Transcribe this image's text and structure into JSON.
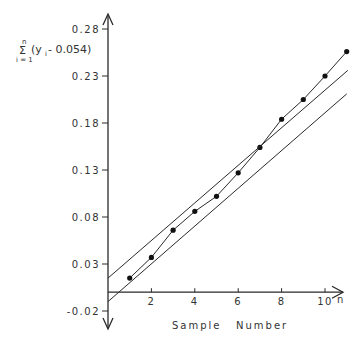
{
  "chart_data": {
    "type": "line",
    "title": "",
    "xlabel": "Sample Number",
    "xlabel_words": [
      "Sample",
      "Number"
    ],
    "x_axis_symbol": "n",
    "ylabel": "Σ (y_i - 0.054), i = 1 to n",
    "ylabel_parts": {
      "sigma": "Σ",
      "upper": "n",
      "lower": "i = 1",
      "expr_open": "(y",
      "sub": "i",
      "expr_close": " - 0.054)"
    },
    "x_ticks": [
      "2",
      "4",
      "6",
      "8",
      "10"
    ],
    "x_tick_values": [
      2,
      4,
      6,
      8,
      10
    ],
    "y_ticks": [
      "0.28",
      "0.23",
      "0.18",
      "0.13",
      "0.08",
      "0.03",
      "-0.02"
    ],
    "y_tick_values": [
      0.28,
      0.23,
      0.18,
      0.13,
      0.08,
      0.03,
      -0.02
    ],
    "xlim": [
      0,
      11.5
    ],
    "ylim": [
      -0.02,
      0.28
    ],
    "grid": false,
    "legend": null,
    "series": [
      {
        "name": "Cumulative sum",
        "style": "line-with-markers",
        "x": [
          1,
          2,
          3,
          4,
          5,
          6,
          7,
          8,
          9,
          10,
          11
        ],
        "values": [
          0.015,
          0.037,
          0.066,
          0.086,
          0.102,
          0.127,
          0.154,
          0.184,
          0.205,
          0.23,
          0.256
        ]
      },
      {
        "name": "Upper control line",
        "style": "line",
        "x": [
          0,
          11.05
        ],
        "values": [
          0.015,
          0.236
        ]
      },
      {
        "name": "Lower control line",
        "style": "line",
        "x": [
          0,
          11.0
        ],
        "values": [
          -0.01,
          0.211
        ]
      }
    ]
  }
}
